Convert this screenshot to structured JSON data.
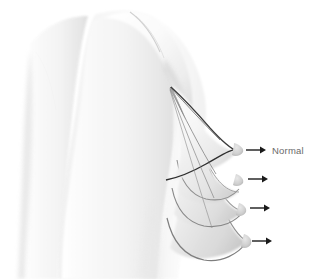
{
  "illustration": {
    "title": "Breast ptosis progression (lateral view)",
    "background_color": "#ffffff",
    "subject": "female-torso-profile",
    "view": "lateral-right-facing"
  },
  "labels": [
    {
      "id": "normal",
      "text": "Normal",
      "x": 268,
      "y": 152,
      "color": "#6a6a6a"
    }
  ],
  "annotations": {
    "arrows": [
      {
        "id": "arrow-normal",
        "label": "Normal",
        "x1": 246,
        "y1": 150,
        "x2": 263,
        "y2": 150,
        "color": "#1a1a1a"
      },
      {
        "id": "arrow-grade-1",
        "label": "",
        "x1": 248,
        "y1": 179,
        "x2": 265,
        "y2": 179,
        "color": "#1a1a1a"
      },
      {
        "id": "arrow-grade-2",
        "label": "",
        "x1": 250,
        "y1": 208,
        "x2": 267,
        "y2": 208,
        "color": "#1a1a1a"
      },
      {
        "id": "arrow-grade-3",
        "label": "",
        "x1": 252,
        "y1": 241,
        "x2": 269,
        "y2": 241,
        "color": "#1a1a1a"
      }
    ]
  },
  "contours": {
    "convergence_point": {
      "x": 171,
      "y": 87
    },
    "stage_count": 4,
    "line_color_dark": "#3b3b3b",
    "line_color_mid": "#8a8a8a",
    "line_color_light": "#b4b4b4"
  },
  "palette": {
    "skin_light": "#fbfbfb",
    "skin_mid": "#f0f0f0",
    "skin_shadow": "#d8d8d8",
    "skin_deep_shadow": "#c0c0c0",
    "outline": "#9a9a9a",
    "arrow": "#1a1a1a",
    "text": "#6a6a6a"
  }
}
